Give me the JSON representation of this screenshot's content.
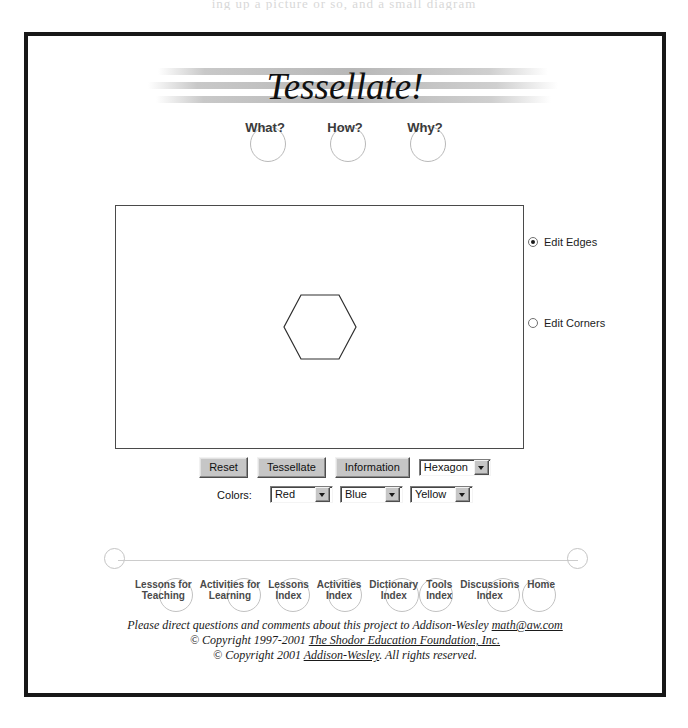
{
  "scan": {
    "top_remnant": "ing up a picture or so, and a small diagram"
  },
  "header": {
    "title": "Tessellate!",
    "nav": [
      {
        "label": "What?",
        "name": "what"
      },
      {
        "label": "How?",
        "name": "how"
      },
      {
        "label": "Why?",
        "name": "why"
      }
    ]
  },
  "canvas": {
    "shape": "hexagon",
    "shape_sides": 6
  },
  "edit_mode": {
    "options": [
      {
        "label": "Edit Edges",
        "selected": true
      },
      {
        "label": "Edit Corners",
        "selected": false
      }
    ]
  },
  "controls": {
    "reset_label": "Reset",
    "tessellate_label": "Tessellate",
    "information_label": "Information",
    "shape_select": {
      "value": "Hexagon",
      "options": [
        "Hexagon"
      ]
    }
  },
  "colors": {
    "label": "Colors:",
    "selects": [
      {
        "value": "Red",
        "options": [
          "Red"
        ]
      },
      {
        "value": "Blue",
        "options": [
          "Blue"
        ]
      },
      {
        "value": "Yellow",
        "options": [
          "Yellow"
        ]
      }
    ]
  },
  "footer_nav": [
    {
      "label": "Lessons for\nTeaching"
    },
    {
      "label": "Activities for\nLearning"
    },
    {
      "label": "Lessons\nIndex"
    },
    {
      "label": "Activities\nIndex"
    },
    {
      "label": "Dictionary\nIndex"
    },
    {
      "label": "Tools\nIndex"
    },
    {
      "label": "Discussions\nIndex"
    },
    {
      "label": "Home"
    }
  ],
  "copyright": {
    "line1_pre": "Please direct questions and comments about this project to Addison-Wesley ",
    "line1_link": "math@aw.com",
    "line2_pre": "© Copyright 1997-2001 ",
    "line2_link": "The Shodor Education Foundation, Inc.",
    "line3_pre": "© Copyright 2001 ",
    "line3_link": "Addison-Wesley",
    "line3_post": ". All rights reserved."
  },
  "theme": {
    "frame_border": "#171717",
    "canvas_border": "#4a4a4a",
    "button_face": "#c6c6c6",
    "ring_gray": "#c2c2c2",
    "text_dark": "#1a1a1a"
  }
}
